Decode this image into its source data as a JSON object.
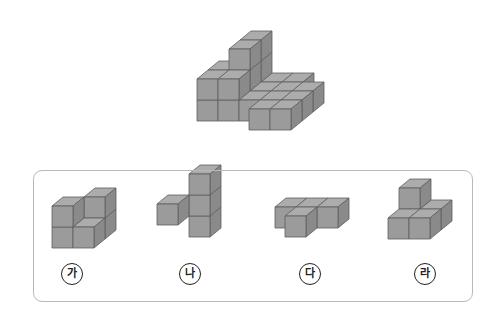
{
  "problem": {
    "target_figure": {
      "name": "stacked-cube-figure",
      "cubes": [
        [
          0,
          0,
          0
        ],
        [
          0,
          0,
          1
        ],
        [
          1,
          0,
          0
        ],
        [
          1,
          0,
          1
        ],
        [
          0,
          1,
          0
        ],
        [
          0,
          1,
          1
        ],
        [
          1,
          1,
          0
        ],
        [
          1,
          1,
          1
        ],
        [
          1,
          1,
          2
        ],
        [
          1,
          2,
          0
        ],
        [
          1,
          2,
          1
        ],
        [
          1,
          2,
          2
        ],
        [
          2,
          1,
          0
        ],
        [
          3,
          1,
          0
        ],
        [
          2,
          0,
          0
        ],
        [
          3,
          0,
          0
        ],
        [
          2,
          2,
          0
        ],
        [
          3,
          2,
          0
        ],
        [
          4,
          1,
          0
        ],
        [
          4,
          0,
          0
        ],
        [
          3,
          -1,
          0
        ],
        [
          4,
          -1,
          0
        ]
      ]
    },
    "colors": {
      "top": "#acacac",
      "front": "#9b9b9b",
      "side": "#8a8a8a",
      "edge": "#5e5e5e",
      "box_border": "#b9b9b9"
    },
    "options": [
      {
        "label": "가",
        "cubes": [
          [
            0,
            0,
            0
          ],
          [
            0,
            0,
            1
          ],
          [
            1,
            1,
            0
          ],
          [
            1,
            0,
            0
          ],
          [
            1,
            1,
            1
          ]
        ]
      },
      {
        "label": "나",
        "cubes": [
          [
            1,
            1,
            0
          ],
          [
            1,
            1,
            1
          ],
          [
            1,
            1,
            2
          ],
          [
            0,
            0,
            1
          ]
        ]
      },
      {
        "label": "다",
        "cubes": [
          [
            0,
            1,
            0
          ],
          [
            1,
            1,
            0
          ],
          [
            2,
            1,
            0
          ],
          [
            1,
            0,
            0
          ]
        ]
      },
      {
        "label": "라",
        "cubes": [
          [
            0,
            1,
            0
          ],
          [
            0,
            1,
            1
          ],
          [
            1,
            1,
            0
          ],
          [
            0,
            0,
            0
          ],
          [
            1,
            0,
            0
          ]
        ]
      }
    ]
  }
}
